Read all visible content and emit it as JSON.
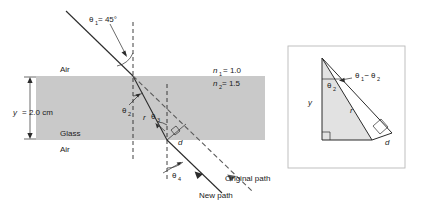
{
  "figure": {
    "main_diagram": {
      "media": [
        {
          "id": "air_top",
          "label": "Air"
        },
        {
          "id": "glass",
          "label": "Glass"
        },
        {
          "id": "air_bottom",
          "label": "Air"
        }
      ],
      "indices": [
        {
          "symbol": "n",
          "subscript": "1",
          "equals": "= 1.0"
        },
        {
          "symbol": "n",
          "subscript": "2",
          "equals": "= 1.5"
        }
      ],
      "thickness": {
        "symbol": "y",
        "value": "= 2.0 cm"
      },
      "angles": [
        {
          "symbol": "θ",
          "subscript": "1",
          "value": " = 45°"
        },
        {
          "symbol": "θ",
          "subscript": "2",
          "value": ""
        },
        {
          "symbol": "θ",
          "subscript": "3",
          "value": ""
        },
        {
          "symbol": "θ",
          "subscript": "4",
          "value": ""
        }
      ],
      "segments": [
        {
          "symbol": "r"
        },
        {
          "symbol": "d"
        }
      ],
      "paths": [
        {
          "id": "original",
          "label": "Original path",
          "style": "dashed"
        },
        {
          "id": "new",
          "label": "New path",
          "style": "solid"
        }
      ]
    },
    "inset": {
      "labels": {
        "height": "y",
        "hypotenuse": "r",
        "offset": "d",
        "angle_theta2": "θ",
        "angle_theta2_sub": "2",
        "angle_diff_t1": "θ",
        "angle_diff_t1_sub": "1",
        "angle_diff_minus": "−",
        "angle_diff_t2": "θ",
        "angle_diff_t2_sub": "2"
      }
    },
    "colors": {
      "glass_fill": "#c9c9c9",
      "inset_fill": "#e2e2e2",
      "line": "#2b2b2b",
      "dashed_ray": "#5a5a5a",
      "inset_border": "#b9b9b9",
      "background": "#ffffff"
    }
  }
}
